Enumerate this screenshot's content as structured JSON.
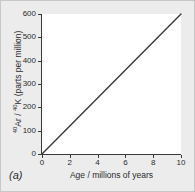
{
  "figure": {
    "panel_label": "(a)",
    "background_color": "#ececed",
    "plot_background_color": "#ffffff",
    "axis_color": "#3a3a3a",
    "line_color": "#3a3a3a"
  },
  "chart_data": {
    "type": "line",
    "title": "",
    "xlabel": "Age / millions of years",
    "ylabel": "40Ar / 40K (parts per million)",
    "ylabel_parts": {
      "sup1": "40",
      "numerator": "Ar",
      "separator": " / ",
      "sup2": "40",
      "denominator": "K",
      "units": " (parts per million)"
    },
    "xlim": [
      0,
      10
    ],
    "ylim": [
      0,
      600
    ],
    "xticks": [
      0,
      2,
      4,
      6,
      8,
      10
    ],
    "yticks": [
      0,
      100,
      200,
      300,
      400,
      500,
      600
    ],
    "xtick_labels": [
      "0",
      "2",
      "4",
      "6",
      "8",
      "10"
    ],
    "ytick_labels": [
      "0",
      "100",
      "200",
      "300",
      "400",
      "500",
      "600"
    ],
    "grid": false,
    "legend": false,
    "series": [
      {
        "name": "40Ar / 40K ratio",
        "x": [
          0,
          1,
          2,
          3,
          4,
          5,
          6,
          7,
          8,
          9,
          10
        ],
        "values": [
          0,
          60,
          120,
          180,
          240,
          300,
          360,
          420,
          480,
          540,
          600
        ],
        "slope": 60,
        "intercept": 0
      }
    ]
  }
}
